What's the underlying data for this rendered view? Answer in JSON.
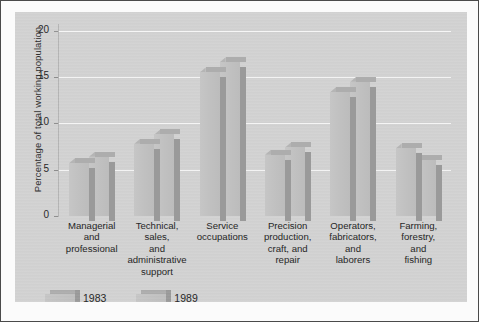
{
  "chart_data": {
    "type": "bar",
    "title": "",
    "xlabel": "",
    "ylabel": "Percentage of total working population",
    "ylim": [
      0,
      20
    ],
    "yticks": [
      0,
      5,
      10,
      15,
      20
    ],
    "grid": true,
    "legend_position": "bottom-left",
    "categories": [
      "Managerial\nand\nprofessional",
      "Technical,\nsales,\nand\nadministrative\nsupport",
      "Service\noccupations",
      "Precision\nproduction,\ncraft, and\nrepair",
      "Operators,\nfabricators,\nand\nlaborers",
      "Farming,\nforestry,\nand\nfishing"
    ],
    "series": [
      {
        "name": "1983",
        "values": [
          5.7,
          7.8,
          15.5,
          6.6,
          13.4,
          7.3
        ]
      },
      {
        "name": "1989",
        "values": [
          6.4,
          8.8,
          16.6,
          7.4,
          14.5,
          6.1
        ]
      }
    ]
  },
  "axis": {
    "y_title": "Percentage of total working population",
    "tick_labels": [
      "20",
      "15",
      "10",
      "5",
      "0"
    ]
  },
  "categories": [
    {
      "lines": [
        "Managerial",
        "and",
        "professional"
      ]
    },
    {
      "lines": [
        "Technical,",
        "sales,",
        "and",
        "administrative",
        "support"
      ]
    },
    {
      "lines": [
        "Service",
        "occupations"
      ]
    },
    {
      "lines": [
        "Precision",
        "production,",
        "craft, and",
        "repair"
      ]
    },
    {
      "lines": [
        "Operators,",
        "fabricators,",
        "and",
        "laborers"
      ]
    },
    {
      "lines": [
        "Farming,",
        "forestry,",
        "and",
        "fishing"
      ]
    }
  ],
  "legend": {
    "items": [
      {
        "label": "1983"
      },
      {
        "label": "1989"
      }
    ]
  },
  "colors": {
    "panel_background": "#d2d2d2",
    "bar_face": "#c1c1c1",
    "bar_top": "#adadad",
    "bar_side": "#9a9a9a",
    "gridline": "#f6f6f6",
    "axis": "#b4b4b4",
    "text": "#232323",
    "frame": "#4a4a4a"
  }
}
